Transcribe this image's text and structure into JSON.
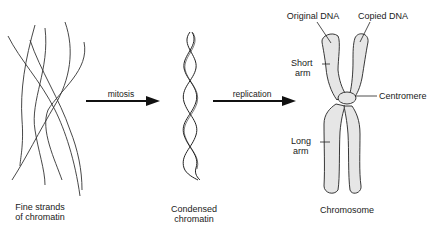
{
  "diagram": {
    "stages": [
      {
        "id": "fine",
        "label_line1": "Fine strands",
        "label_line2": "of chromatin"
      },
      {
        "id": "condensed",
        "label_line1": "Condensed",
        "label_line2": "chromatin"
      },
      {
        "id": "chromosome",
        "label_line1": "Chromosome"
      }
    ],
    "arrows": [
      {
        "from": "fine",
        "to": "condensed",
        "label": "mitosis"
      },
      {
        "from": "condensed",
        "to": "chromosome",
        "label": "replication"
      }
    ],
    "chromosome_parts": {
      "original_dna": "Original DNA",
      "copied_dna": "Copied DNA",
      "short_arm_1": "Short",
      "short_arm_2": "arm",
      "centromere": "Centromere",
      "long_arm_1": "Long",
      "long_arm_2": "arm"
    },
    "colors": {
      "line": "#1a1a1a",
      "chromosome_fill": "#e6e6e6"
    }
  }
}
